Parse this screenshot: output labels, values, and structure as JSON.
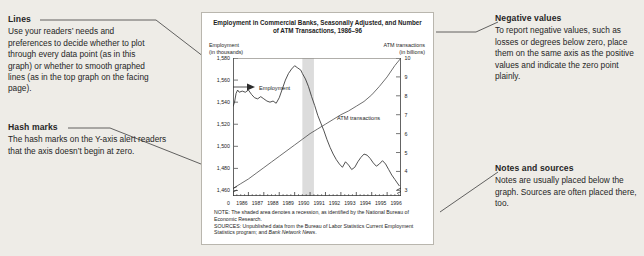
{
  "annotations": {
    "lines": {
      "heading": "Lines",
      "body": "Use your readers’ needs and preferences to decide whether to plot through every data point (as in this graph) or whether to smooth graphed lines (as in the top graph on the facing page)."
    },
    "hash_marks": {
      "heading": "Hash marks",
      "body": "The hash marks on the Y-axis alert readers that the axis doesn’t begin at zero."
    },
    "negative_values": {
      "heading": "Negative values",
      "body": "To report negative values, such as losses or degrees below zero, place them on the same axis as the positive values and indicate the zero point plainly."
    },
    "notes_and_sources": {
      "heading": "Notes and sources",
      "body": "Notes are usually placed below the graph. Sources are often placed there, too."
    }
  },
  "chart_panel": {
    "title": "Employment in Commercial Banks, Seasonally Adjusted, and Number of ATM Transactions, 1986–96",
    "left_axis_caption": "Employment\n(in thousands)",
    "right_axis_caption": "ATM transactions\n(in billions)",
    "zero_label": "0",
    "note": "NOTE: The shaded area denotes a recession, as identified by the National Bureau of Economic Research.",
    "sources_prefix": "SOURCES: Unpublished data from the Bureau of Labor Statistics Current Employment Statistics program; and ",
    "sources_italic": "Bank Network News",
    "sources_suffix": "."
  },
  "chart_data": {
    "type": "line",
    "title": "Employment in Commercial Banks, Seasonally Adjusted, and Number of ATM Transactions, 1986–96",
    "xlabel": "",
    "grid": false,
    "legend": "in-plot labels",
    "x_ticks": [
      "1986",
      "1987",
      "1988",
      "1989",
      "1990",
      "1991",
      "1992",
      "1993",
      "1994",
      "1995",
      "1996"
    ],
    "xlim": [
      1986,
      1996.9
    ],
    "left_axis": {
      "label": "Employment (in thousands)",
      "ylim": [
        1455,
        1580
      ],
      "ticks": [
        1460,
        1480,
        1500,
        1520,
        1540,
        1560,
        1580
      ],
      "tick_labels": [
        "1,460",
        "1,480",
        "1,500",
        "1,520",
        "1,540",
        "1,560",
        "1,580"
      ],
      "broken_axis": true
    },
    "right_axis": {
      "label": "ATM transactions (in billions)",
      "ylim": [
        2.7,
        10
      ],
      "ticks": [
        3,
        4,
        5,
        6,
        7,
        8,
        9,
        10
      ],
      "tick_labels": [
        "3",
        "4",
        "5",
        "6",
        "7",
        "8",
        "9",
        "10"
      ],
      "broken_axis": true
    },
    "shaded_region": {
      "label": "recession",
      "x_start": 1990.5,
      "x_end": 1991.25,
      "color": "#dcdcdc"
    },
    "series": [
      {
        "name": "Employment",
        "axis": "left",
        "units": "thousands",
        "x": [
          1986.0,
          1986.1,
          1986.2,
          1986.3,
          1986.4,
          1986.6,
          1986.8,
          1987.0,
          1987.2,
          1987.4,
          1987.6,
          1987.8,
          1988.0,
          1988.2,
          1988.4,
          1988.6,
          1988.8,
          1989.0,
          1989.2,
          1989.4,
          1989.6,
          1989.8,
          1990.0,
          1990.2,
          1990.4,
          1990.5,
          1990.7,
          1990.9,
          1991.1,
          1991.3,
          1991.5,
          1991.7,
          1991.9,
          1992.1,
          1992.3,
          1992.5,
          1992.7,
          1992.9,
          1993.1,
          1993.3,
          1993.5,
          1993.7,
          1993.9,
          1994.1,
          1994.3,
          1994.5,
          1994.7,
          1994.9,
          1995.1,
          1995.3,
          1995.5,
          1995.7,
          1995.9,
          1996.1,
          1996.3,
          1996.5,
          1996.8
        ],
        "y": [
          1536,
          1540,
          1548,
          1551,
          1549,
          1550,
          1549,
          1551,
          1547,
          1544,
          1543,
          1545,
          1543,
          1541,
          1540,
          1541,
          1539,
          1544,
          1552,
          1560,
          1566,
          1570,
          1573,
          1571,
          1569,
          1566,
          1561,
          1554,
          1545,
          1537,
          1528,
          1521,
          1514,
          1506,
          1499,
          1493,
          1488,
          1484,
          1481,
          1486,
          1483,
          1479,
          1481,
          1486,
          1490,
          1493,
          1492,
          1489,
          1485,
          1482,
          1484,
          1487,
          1484,
          1479,
          1474,
          1470,
          1464
        ]
      },
      {
        "name": "ATM transactions",
        "axis": "right",
        "units": "billions",
        "x": [
          1986.0,
          1986.5,
          1987.0,
          1987.5,
          1988.0,
          1988.5,
          1989.0,
          1989.5,
          1990.0,
          1990.5,
          1991.0,
          1991.5,
          1992.0,
          1992.5,
          1993.0,
          1993.5,
          1994.0,
          1994.5,
          1995.0,
          1995.5,
          1996.0,
          1996.5,
          1996.9
        ],
        "y": [
          3.1,
          3.35,
          3.6,
          3.9,
          4.2,
          4.5,
          4.8,
          5.1,
          5.4,
          5.7,
          6.0,
          6.25,
          6.5,
          6.75,
          7.0,
          7.2,
          7.45,
          7.7,
          8.05,
          8.5,
          9.0,
          9.6,
          10.0
        ]
      }
    ]
  }
}
